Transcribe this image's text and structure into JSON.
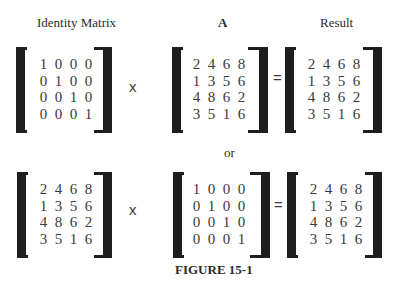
{
  "labels": {
    "identity": "Identity Matrix",
    "a": "A",
    "result": "Result",
    "or": "or",
    "caption": "FIGURE 15-1"
  },
  "operators": {
    "times": "x",
    "equals": "="
  },
  "matrices": {
    "identity": [
      [
        1,
        0,
        0,
        0
      ],
      [
        0,
        1,
        0,
        0
      ],
      [
        0,
        0,
        1,
        0
      ],
      [
        0,
        0,
        0,
        1
      ]
    ],
    "a": [
      [
        2,
        4,
        6,
        8
      ],
      [
        1,
        3,
        5,
        6
      ],
      [
        4,
        8,
        6,
        2
      ],
      [
        3,
        5,
        1,
        6
      ]
    ],
    "result": [
      [
        2,
        4,
        6,
        8
      ],
      [
        1,
        3,
        5,
        6
      ],
      [
        4,
        8,
        6,
        2
      ],
      [
        3,
        5,
        1,
        6
      ]
    ]
  },
  "rows": [
    {
      "name": "identity-times-a",
      "left": "identity",
      "operator1": "x",
      "middle": "a",
      "operator2": "=",
      "right": "result"
    },
    {
      "name": "a-times-identity",
      "left": "a",
      "operator1": "x",
      "middle": "identity",
      "operator2": "=",
      "right": "result"
    }
  ]
}
